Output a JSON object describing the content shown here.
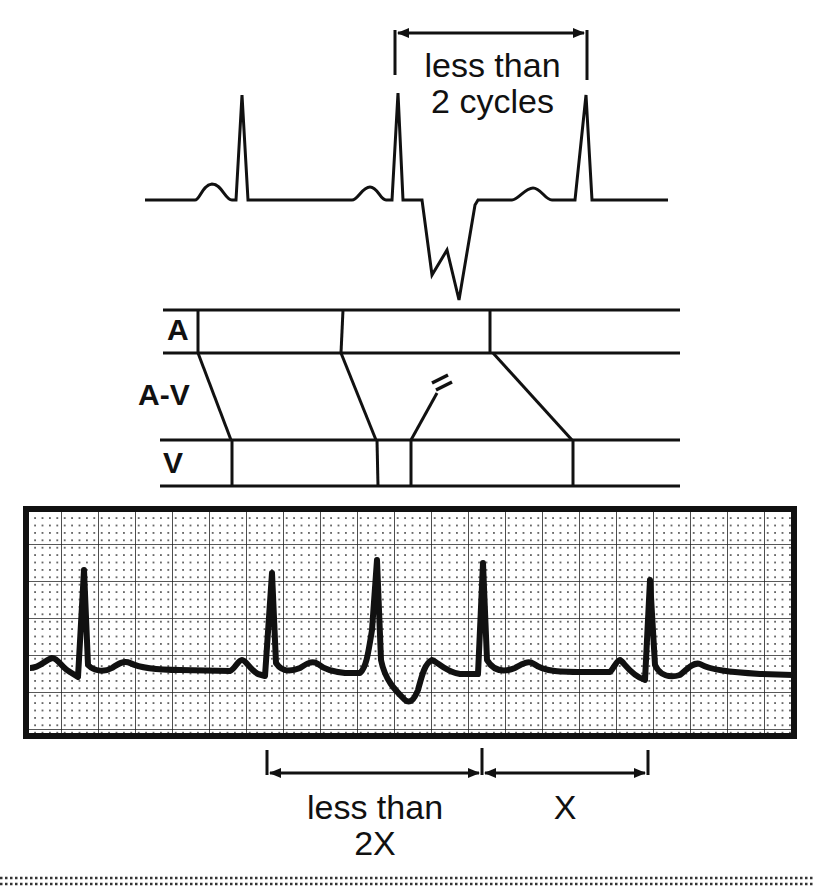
{
  "diagram": {
    "type": "ECG ladder diagram with rhythm strip",
    "top_annotation": {
      "line1": "less than",
      "line2": "2 cycles"
    },
    "ladder": {
      "lanes": [
        {
          "id": "atrial",
          "label": "A"
        },
        {
          "id": "av_node",
          "label": "A-V"
        },
        {
          "id": "ventricle",
          "label": "V"
        }
      ],
      "blocked_conduction_marker": "="
    },
    "bottom_annotations": {
      "left": {
        "line1": "less than",
        "line2": "2X"
      },
      "right": {
        "line1": "X"
      }
    },
    "colors": {
      "ink": "#111111",
      "paper": "#ffffff",
      "grid": "#222222"
    }
  }
}
